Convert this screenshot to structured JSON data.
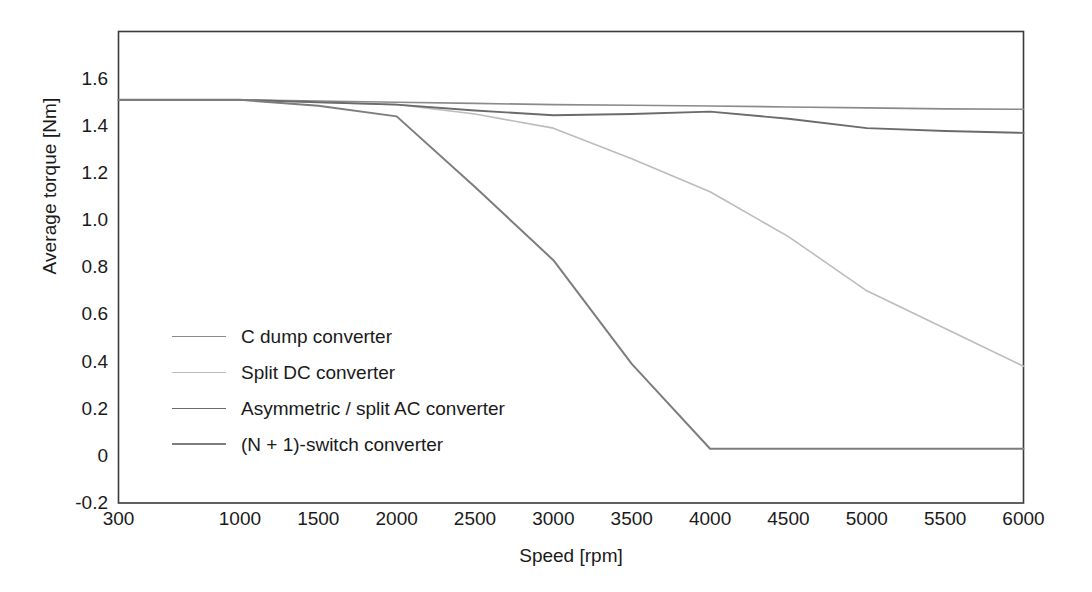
{
  "chart_data": {
    "type": "line",
    "title": "",
    "xlabel": "Speed [rpm]",
    "ylabel": "Average torque [Nm]",
    "x_tick_labels": [
      "300",
      "1000",
      "1500",
      "2000",
      "2500",
      "3000",
      "3500",
      "4000",
      "4500",
      "5000",
      "5500",
      "6000"
    ],
    "x_categorical": true,
    "y_tick_labels": [
      "1.6",
      "1.4",
      "1.2",
      "1.0",
      "0.8",
      "0.6",
      "0.4",
      "0.2",
      "0",
      "-0.2"
    ],
    "ylim": [
      -0.2,
      1.8
    ],
    "yticks": [
      1.6,
      1.4,
      1.2,
      1.0,
      0.8,
      0.6,
      0.4,
      0.2,
      0,
      -0.2
    ],
    "grid": false,
    "legend_position": "center-left-inside",
    "frame": "box",
    "x": [
      300,
      1000,
      1500,
      2000,
      2500,
      3000,
      3500,
      4000,
      4500,
      5000,
      5500,
      6000
    ],
    "series": [
      {
        "name": "C dump converter",
        "color": "#8a8a8a",
        "line_width": 1.6,
        "values": [
          1.51,
          1.51,
          1.505,
          1.5,
          1.495,
          1.49,
          1.487,
          1.484,
          1.48,
          1.476,
          1.472,
          1.47
        ]
      },
      {
        "name": "Split DC converter",
        "color": "#bcbcbc",
        "line_width": 1.6,
        "values": [
          1.51,
          1.51,
          1.5,
          1.49,
          1.45,
          1.39,
          1.26,
          1.12,
          0.93,
          0.7,
          0.54,
          0.38
        ]
      },
      {
        "name": "Asymmetric / split AC converter",
        "color": "#6b6b6b",
        "line_width": 1.9,
        "values": [
          1.51,
          1.51,
          1.5,
          1.49,
          1.465,
          1.445,
          1.45,
          1.46,
          1.43,
          1.39,
          1.378,
          1.37
        ]
      },
      {
        "name": "(N + 1)-switch converter",
        "color": "#7d7d7d",
        "line_width": 2.0,
        "values": [
          1.51,
          1.51,
          1.485,
          1.44,
          1.14,
          0.83,
          0.39,
          0.03,
          0.03,
          0.03,
          0.03,
          0.03
        ]
      }
    ],
    "annotations": [
      {
        "note": "(N + 1)-switch converter reaches its floor of ~0.03 Nm at about 3600 rpm and stays flat to 6000 rpm"
      }
    ]
  },
  "legend": {
    "items": [
      {
        "label": "C dump converter",
        "color": "#8a8a8a",
        "width": "1.6px"
      },
      {
        "label": "Split DC converter",
        "color": "#bcbcbc",
        "width": "1.6px"
      },
      {
        "label": "Asymmetric / split AC converter",
        "color": "#6b6b6b",
        "width": "1.9px"
      },
      {
        "label": "(N + 1)-switch converter",
        "color": "#7d7d7d",
        "width": "2.0px"
      }
    ]
  },
  "axes": {
    "frame_color": "#3a3a3a",
    "background": "#ffffff"
  }
}
